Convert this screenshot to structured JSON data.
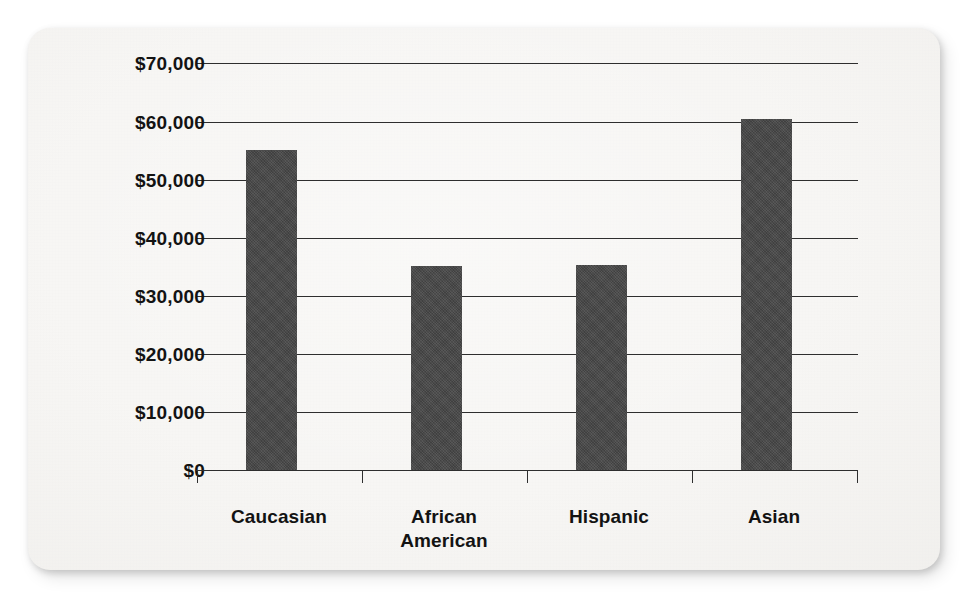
{
  "figure": {
    "card_background": "#f7f6f4",
    "page_background": "#ffffff",
    "bar_color": "#464646",
    "axis_color": "#2e2e2e",
    "text_color": "#131313"
  },
  "chart_data": {
    "type": "bar",
    "title": "",
    "subtitle": "",
    "xlabel": "",
    "ylabel": "",
    "categories": [
      "Caucasian",
      "African American",
      "Hispanic",
      "Asian"
    ],
    "values": [
      55000,
      35000,
      35200,
      60300
    ],
    "value_labels": [
      "$55,000",
      "$35,000",
      "$35,200",
      "$60,300"
    ],
    "series": [
      {
        "name": "Median household income",
        "values": [
          55000,
          35000,
          35200,
          60300
        ]
      }
    ],
    "ylim": [
      0,
      70000
    ],
    "ytick_values": [
      70000,
      60000,
      50000,
      40000,
      30000,
      20000,
      10000,
      0
    ],
    "ytick_labels": [
      "$70,000",
      "$60,000",
      "$50,000",
      "$40,000",
      "$30,000",
      "$20,000",
      "$10,000",
      "$0"
    ],
    "ytick_step": 10000,
    "grid": true,
    "grid_axis": "y",
    "legend": false,
    "legend_position": "none",
    "annotations": []
  },
  "axis": {
    "y_labels": [
      {
        "text": "$70,000",
        "value": 70000
      },
      {
        "text": "$60,000",
        "value": 60000
      },
      {
        "text": "$50,000",
        "value": 50000
      },
      {
        "text": "$40,000",
        "value": 40000
      },
      {
        "text": "$30,000",
        "value": 30000
      },
      {
        "text": "$20,000",
        "value": 20000
      },
      {
        "text": "$10,000",
        "value": 10000
      },
      {
        "text": "$0",
        "value": 0
      }
    ],
    "x_labels": [
      {
        "line1": "Caucasian",
        "line2": ""
      },
      {
        "line1": "African",
        "line2": "American"
      },
      {
        "line1": "Hispanic",
        "line2": ""
      },
      {
        "line1": "Asian",
        "line2": ""
      }
    ]
  },
  "bars": [
    {
      "category": "Caucasian",
      "value": 55000
    },
    {
      "category": "African American",
      "value": 35000
    },
    {
      "category": "Hispanic",
      "value": 35200
    },
    {
      "category": "Asian",
      "value": 60300
    }
  ]
}
